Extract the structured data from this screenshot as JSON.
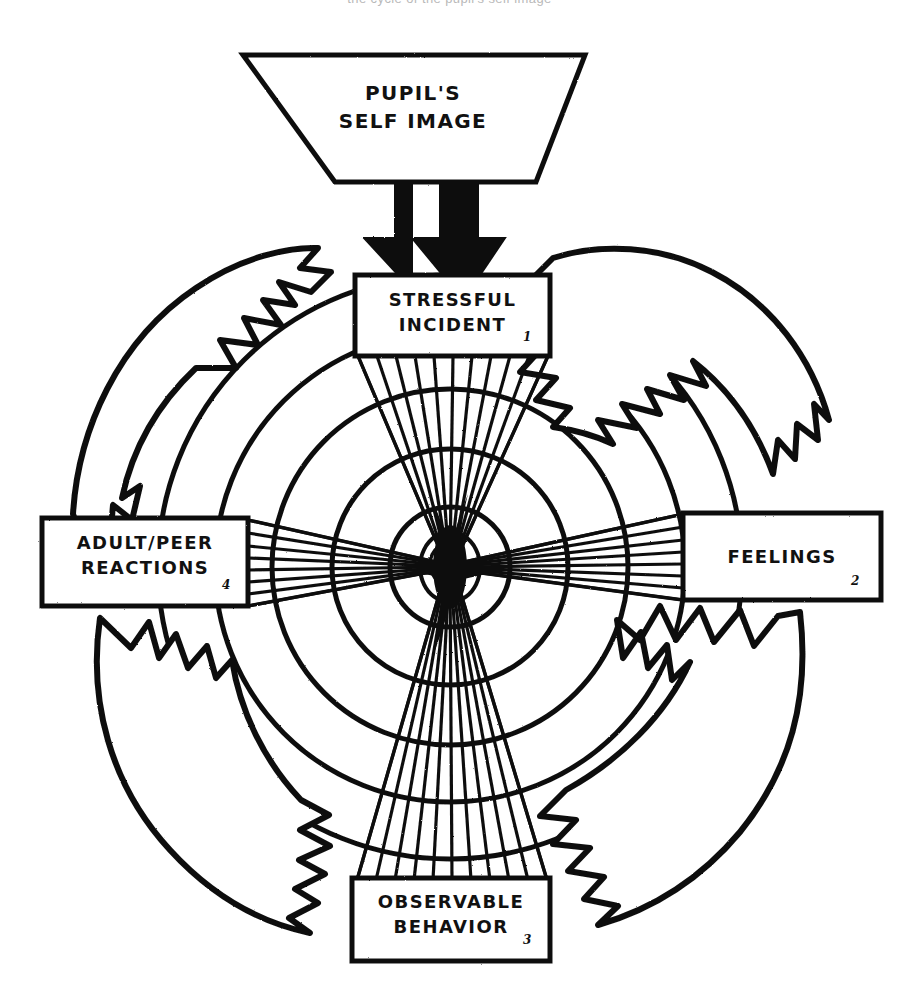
{
  "page": {
    "background_color": "#ffffff",
    "ink_color": "#111111",
    "cropped_header_text": "the cycle of the pupil's self image",
    "width": 899,
    "height": 999
  },
  "funnel": {
    "name": "pupils-self-image",
    "line1": "PUPIL'S",
    "line2": "SELF IMAGE"
  },
  "arrows": {
    "down_double": {
      "name": "double-down-arrow",
      "count": 2,
      "direction": "down"
    },
    "cycle_arrows": [
      {
        "name": "cycle-arrow-top-left",
        "from": "adult-peer-reactions",
        "to": "stressful-incident",
        "direction": "clockwise"
      },
      {
        "name": "cycle-arrow-top-right",
        "from": "stressful-incident",
        "to": "feelings",
        "direction": "clockwise"
      },
      {
        "name": "cycle-arrow-bottom-right",
        "from": "feelings",
        "to": "observable-behavior",
        "direction": "clockwise"
      },
      {
        "name": "cycle-arrow-bottom-left",
        "from": "observable-behavior",
        "to": "adult-peer-reactions",
        "direction": "clockwise"
      }
    ]
  },
  "nodes": [
    {
      "id": "stressful-incident",
      "position": "top",
      "number": "1",
      "lines": [
        "STRESSFUL",
        "INCIDENT"
      ],
      "text": "STRESSFUL INCIDENT"
    },
    {
      "id": "feelings",
      "position": "right",
      "number": "2",
      "lines": [
        "FEELINGS"
      ],
      "text": "FEELINGS"
    },
    {
      "id": "observable-behavior",
      "position": "bottom",
      "number": "3",
      "lines": [
        "OBSERVABLE",
        "BEHAVIOR"
      ],
      "text": "OBSERVABLE BEHAVIOR"
    },
    {
      "id": "adult-peer-reactions",
      "position": "left",
      "number": "4",
      "lines": [
        "ADULT/PEER",
        "REACTIONS"
      ],
      "text": "ADULT/PEER REACTIONS"
    }
  ],
  "rings": {
    "name": "concentric-ripple-rings",
    "count": 5,
    "center": {
      "x": 450,
      "y": 567
    },
    "radii": [
      292,
      235,
      178,
      118,
      60
    ]
  },
  "beams": {
    "name": "converging-beam-fans",
    "lines_per_fan": 11,
    "converge_point": {
      "x": 450,
      "y": 567
    }
  }
}
